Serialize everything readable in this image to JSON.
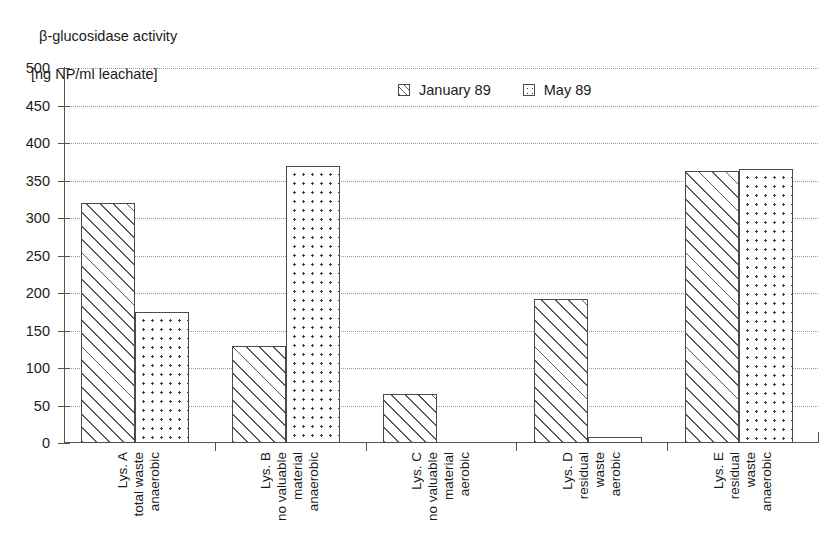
{
  "title": {
    "line1": "β-glucosidase activity",
    "line2": "[ng NP/ml leachate]"
  },
  "legend": {
    "position": "top-center",
    "items": [
      {
        "label": "January 89",
        "pattern": "diagonal-hatch"
      },
      {
        "label": "May 89",
        "pattern": "dotted"
      }
    ]
  },
  "axis": {
    "y_ticks": [
      "500",
      "450",
      "400",
      "350",
      "300",
      "250",
      "200",
      "150",
      "100",
      "50",
      "0"
    ]
  },
  "chart_data": {
    "type": "bar",
    "title": "β-glucosidase activity [ng NP/ml leachate]",
    "xlabel": "",
    "ylabel": "β-glucosidase activity [ng NP/ml leachate]",
    "ylim": [
      0,
      500
    ],
    "ytick_step": 50,
    "grid": true,
    "legend_position": "top-center",
    "categories": [
      "Lys. A total waste anaerobic",
      "Lys. B no valuable material anaerobic",
      "Lys. C no valuable material aerobic",
      "Lys. D residual waste aerobic",
      "Lys. E residual waste anaerobic"
    ],
    "category_lines": [
      [
        "Lys. A",
        "total waste",
        "anaerobic"
      ],
      [
        "Lys. B",
        "no valuable",
        "material",
        "anaerobic"
      ],
      [
        "Lys. C",
        "no valuable",
        "material",
        "aerobic"
      ],
      [
        "Lys. D",
        "residual",
        "waste",
        "aerobic"
      ],
      [
        "Lys. E",
        "residual",
        "waste",
        "anaerobic"
      ]
    ],
    "series": [
      {
        "name": "January 89",
        "pattern": "diagonal-hatch",
        "values": [
          320,
          130,
          65,
          192,
          363
        ]
      },
      {
        "name": "May 89",
        "pattern": "dotted",
        "values": [
          175,
          370,
          0,
          8,
          365
        ]
      }
    ]
  }
}
